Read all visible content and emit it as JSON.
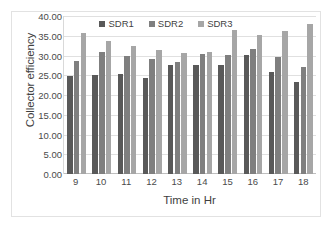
{
  "chart_data": {
    "type": "bar",
    "title": "",
    "xlabel": "Time in Hr",
    "ylabel": "Collector efficiency",
    "categories": [
      "9",
      "10",
      "11",
      "12",
      "13",
      "14",
      "15",
      "16",
      "17",
      "18"
    ],
    "series": [
      {
        "name": "SDR1",
        "color": "#595959",
        "values": [
          24.8,
          25.1,
          25.3,
          24.3,
          27.5,
          27.6,
          27.7,
          30.2,
          25.9,
          23.3
        ]
      },
      {
        "name": "SDR2",
        "color": "#7f7f7f",
        "values": [
          28.6,
          31.0,
          30.0,
          29.2,
          28.3,
          30.4,
          30.1,
          31.6,
          29.7,
          27.2
        ]
      },
      {
        "name": "SDR3",
        "color": "#a6a6a6",
        "values": [
          35.7,
          33.6,
          32.5,
          31.4,
          30.6,
          30.8,
          36.5,
          35.3,
          36.1,
          38.0
        ]
      }
    ],
    "ylim": [
      0,
      40
    ],
    "yticks": [
      "0.00",
      "5.00",
      "10.00",
      "15.00",
      "20.00",
      "25.00",
      "30.00",
      "35.00",
      "40.00"
    ],
    "ytick_values": [
      0,
      5,
      10,
      15,
      20,
      25,
      30,
      35,
      40
    ],
    "grid": true,
    "legend_position": "top-center",
    "legend": [
      "SDR1",
      "SDR2",
      "SDR3"
    ]
  }
}
